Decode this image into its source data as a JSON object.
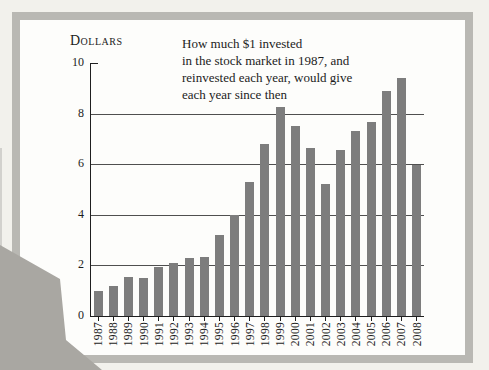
{
  "photo": {
    "background_color": "#f2f1ec",
    "frame_color": "#b9b8b3",
    "panel_color": "#fdfdfb",
    "corner_overlay_color": "#a9a7a2",
    "edge_sliver_color": "#d2d1cd"
  },
  "chart_data": {
    "type": "bar",
    "unit_label": "Dollars",
    "title": "How much $1 invested in the stock market in 1987, and reinvested each year, would give each year since then",
    "title_lines": [
      "How much $1 invested",
      "in the stock market in 1987, and",
      "reinvested each year, would give",
      "each year since then"
    ],
    "categories": [
      "1987",
      "1988",
      "1989",
      "1990",
      "1991",
      "1992",
      "1993",
      "1994",
      "1995",
      "1996",
      "1997",
      "1998",
      "1999",
      "2000",
      "2001",
      "2002",
      "2003",
      "2004",
      "2005",
      "2006",
      "2007",
      "2008"
    ],
    "values": [
      1.0,
      1.2,
      1.55,
      1.5,
      1.95,
      2.1,
      2.3,
      2.35,
      3.2,
      4.0,
      5.3,
      6.8,
      8.25,
      7.5,
      6.65,
      5.2,
      6.55,
      7.3,
      7.65,
      8.9,
      9.4,
      5.95
    ],
    "ylim": [
      0,
      10
    ],
    "yticks": [
      0,
      2,
      4,
      6,
      8,
      10
    ],
    "gridlines_at": [
      2,
      4,
      6,
      8
    ],
    "grid": "on",
    "legend": "none",
    "xlabel_rotation": -90,
    "bar_color": "#7d7d7d",
    "grid_color": "#4f4f4f",
    "axis_color": "#1f1f1f",
    "text_color": "#1c1c1c"
  }
}
